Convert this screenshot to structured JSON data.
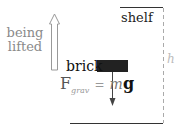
{
  "diagram": {
    "lift_label_line1": "being",
    "lift_label_line2": "lifted",
    "shelf_label": "shelf",
    "brick_label": "brick",
    "force": {
      "symbol": "F",
      "subscript": "grav",
      "equals": "=",
      "mass": "m",
      "gravity": "g"
    },
    "height_label": "h",
    "colors": {
      "brick": "#222222",
      "lines": "#333333",
      "dashed": "#aaaaaa",
      "lift_arrow": "#999999"
    }
  }
}
